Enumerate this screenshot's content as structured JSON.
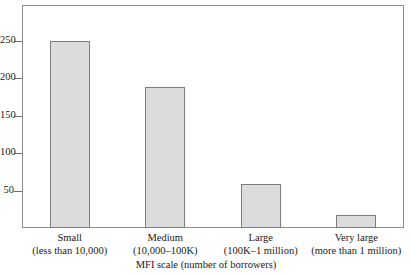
{
  "chart_data": {
    "type": "bar",
    "title": "",
    "subtitle": "",
    "xlabel": "MFI scale (number of borrowers)",
    "ylabel": "",
    "categories": [
      "Small",
      "Medium",
      "Large",
      "Very large"
    ],
    "category_sublabels": [
      "(less than 10,000)",
      "(10,000–100K)",
      "(100K–1 million)",
      "(more than 1 million)"
    ],
    "values": [
      250,
      188,
      59,
      17
    ],
    "ylim": [
      0,
      298
    ],
    "yticks": [
      50,
      100,
      150,
      200,
      250
    ],
    "ytick_labels": [
      "50",
      "100",
      "150",
      "200",
      "250"
    ],
    "grid": false,
    "legend": null,
    "legend_position": "none",
    "bar_fill_color": "#dcdcdc",
    "bar_border_color": "#7d7d7d",
    "frame_color": "#8c8c8c",
    "text_color": "#1a1a1a"
  }
}
